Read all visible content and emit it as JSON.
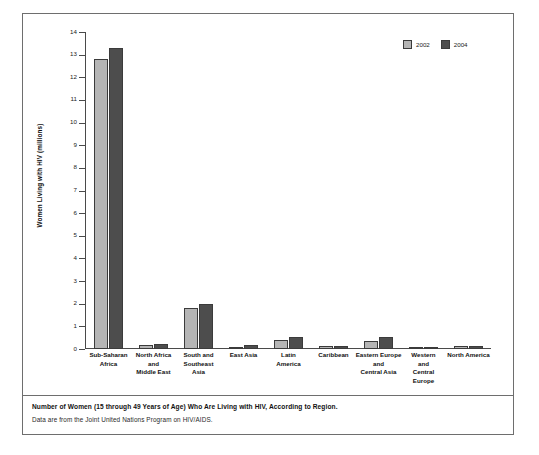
{
  "figure": {
    "caption_title": "Number of Women (15 through 49 Years of Age) Who Are Living with HIV, According to Region.",
    "caption_source": "Data are from the Joint United Nations Program on HIV/AIDS."
  },
  "legend": {
    "position": "top-right",
    "entries": [
      {
        "label": "2002",
        "color": "#b5b5b5"
      },
      {
        "label": "2004",
        "color": "#4d4d4d"
      }
    ]
  },
  "chart_data": {
    "type": "bar",
    "title": "Number of Women (15 through 49 Years of Age) Who Are Living with HIV, According to Region.",
    "subtitle": "Data are from the Joint United Nations Program on HIV/AIDS.",
    "xlabel": "",
    "ylabel": "Women Living with HIV (millions)",
    "ylim": [
      0,
      14
    ],
    "yticks": [
      "0",
      "1",
      "2",
      "3",
      "4",
      "5",
      "6",
      "7",
      "8",
      "9",
      "10",
      "11",
      "12",
      "13",
      "14"
    ],
    "grid": false,
    "categories": [
      "Sub-Saharan Africa",
      "North Africa and Middle East",
      "South and Southeast Asia",
      "East Asia",
      "Latin America",
      "Caribbean",
      "Eastern Europe and Central Asia",
      "Western and Central Europe",
      "North America"
    ],
    "category_labels_wrapped": [
      "Sub-Saharan\nAfrica",
      "North Africa\nand\nMiddle East",
      "South and\nSoutheast\nAsia",
      "East Asia",
      "Latin\nAmerica",
      "Caribbean",
      "Eastern Europe\nand\nCentral Asia",
      "Western\nand\nCentral\nEurope",
      "North America"
    ],
    "series": [
      {
        "name": "2002",
        "color": "#b5b5b5",
        "values": [
          12.8,
          0.18,
          1.8,
          0.1,
          0.38,
          0.13,
          0.35,
          0.09,
          0.12
        ]
      },
      {
        "name": "2004",
        "color": "#4d4d4d",
        "values": [
          13.3,
          0.21,
          2.0,
          0.16,
          0.54,
          0.15,
          0.54,
          0.11,
          0.14
        ]
      }
    ]
  }
}
